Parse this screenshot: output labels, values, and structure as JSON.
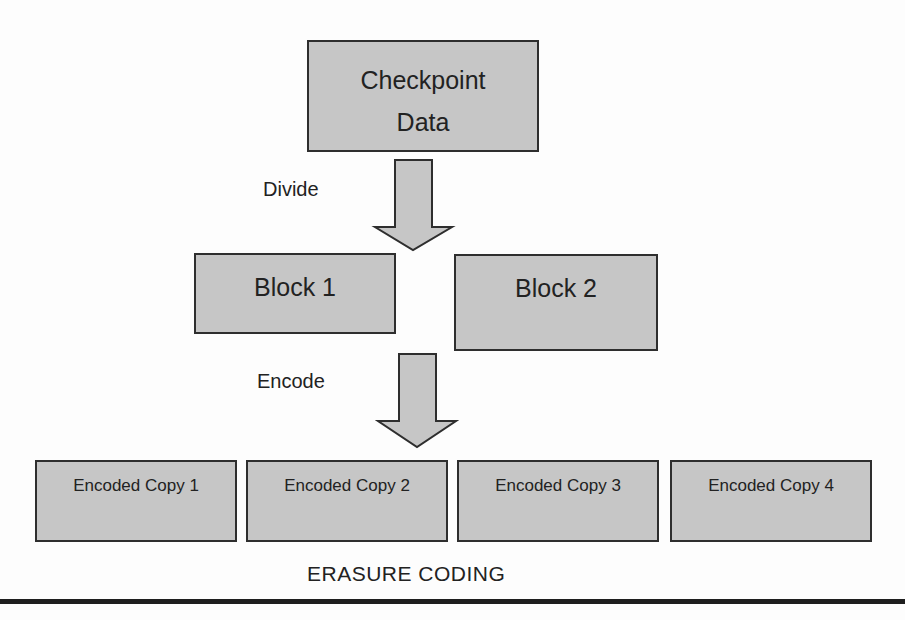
{
  "diagram": {
    "title": "ERASURE CODING",
    "nodes": {
      "source": {
        "line1": "Checkpoint",
        "line2": "Data"
      },
      "block1": "Block 1",
      "block2": "Block 2",
      "copies": [
        "Encoded Copy 1",
        "Encoded Copy 2",
        "Encoded Copy 3",
        "Encoded Copy 4"
      ]
    },
    "edges": {
      "divide": "Divide",
      "encode": "Encode"
    },
    "colors": {
      "box_fill": "#c6c6c6",
      "box_border": "#2e2e2e",
      "text": "#222222",
      "rule": "#1e1e1e"
    }
  }
}
